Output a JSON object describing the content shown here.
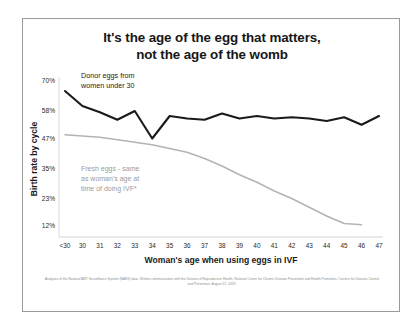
{
  "card": {
    "title_line1": "It's the age of the egg that matters,",
    "title_line2": "not the age of the womb",
    "source_note": "Analyses of the National ART Surveillance System (NASS) data. Written communication with the Division of Reproductive Health, National Center for Chronic Disease Prevention and Health Promotion, Centers for Disease Control and Prevention, August 22, 2019."
  },
  "annotations": {
    "donor_label_line1": "Donor eggs from",
    "donor_label_line2": "women under 30",
    "fresh_label_line1": "Fresh eggs - same",
    "fresh_label_line2": "as woman's age at",
    "fresh_label_line3": "time of doing IVF*"
  },
  "colors": {
    "donor_line": "#1a1a1a",
    "fresh_line": "#b3b3b3",
    "axis": "#bdbdbd",
    "border": "#9a9a9a",
    "text": "#1c1c1c",
    "muted_text": "#9a9a9a"
  },
  "chart_data": {
    "type": "line",
    "title": "It's the age of the egg that matters, not the age of the womb",
    "xlabel": "Woman's age when using eggs in IVF",
    "ylabel": "Birth rate by cycle",
    "categories": [
      "<30",
      "30",
      "31",
      "32",
      "33",
      "34",
      "35",
      "36",
      "37",
      "38",
      "39",
      "40",
      "41",
      "42",
      "43",
      "44",
      "45",
      "46",
      "47"
    ],
    "ytick_labels": [
      "70%",
      "58%",
      "47%",
      "35%",
      "23%",
      "12%"
    ],
    "ytick_values": [
      70,
      58,
      47,
      35,
      23,
      12
    ],
    "ylim": [
      6,
      74
    ],
    "grid": false,
    "legend": "annotations on plot",
    "series": [
      {
        "name": "Donor eggs from women under 30",
        "color": "#1a1a1a",
        "values": [
          66,
          60,
          57.5,
          54.5,
          58,
          47,
          56,
          55,
          54.5,
          57,
          55,
          56,
          55,
          55.5,
          55,
          54,
          55.5,
          52.5,
          56
        ]
      },
      {
        "name": "Fresh eggs - same as woman's age at time of doing IVF*",
        "color": "#b3b3b3",
        "values": [
          48.5,
          48,
          47.5,
          46.5,
          45.5,
          44.5,
          43,
          41.5,
          39,
          36,
          32.5,
          29.5,
          26,
          23,
          19.5,
          16,
          13,
          12.5,
          null
        ]
      }
    ]
  }
}
